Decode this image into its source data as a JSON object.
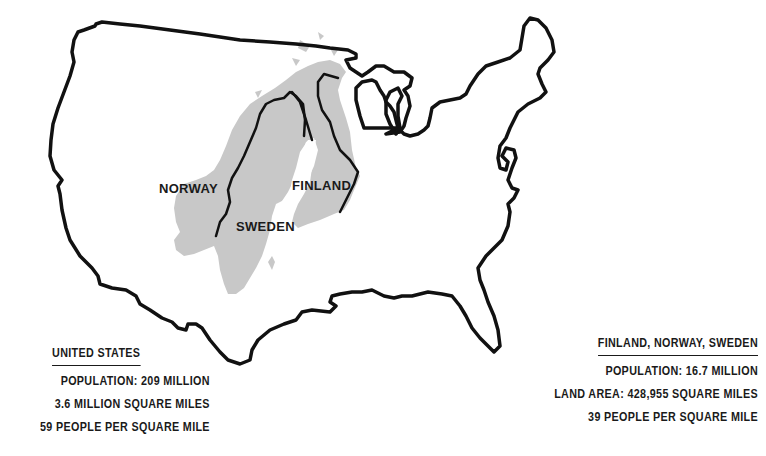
{
  "map": {
    "outline_color": "#111111",
    "nordic_fill": "#c8c8c8",
    "background": "#ffffff",
    "labels": [
      {
        "id": "norway",
        "text": "NORWAY"
      },
      {
        "id": "sweden",
        "text": "SWEDEN"
      },
      {
        "id": "finland",
        "text": "FINLAND"
      }
    ]
  },
  "legend_us": {
    "title": "UNITED STATES",
    "lines": [
      "POPULATION:  209 MILLION",
      "3.6 MILLION SQUARE MILES",
      "59 PEOPLE PER SQUARE MILE"
    ]
  },
  "legend_nordic": {
    "title": "FINLAND,  NORWAY,  SWEDEN",
    "lines": [
      "POPULATION: 16.7 MILLION",
      "LAND  AREA: 428,955 SQUARE MILES",
      "39 PEOPLE PER SQUARE MILE"
    ]
  }
}
